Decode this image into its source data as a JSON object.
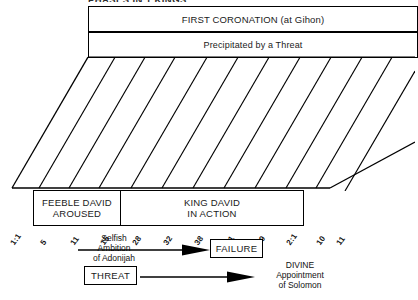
{
  "chart": {
    "title": "PHASES IN 1 KINGS"
  },
  "banner": {
    "heading": "FIRST CORONATION (at Gihon)",
    "subheading": "Precipitated by a Threat"
  },
  "stripes": {
    "verse_labels": [
      "1:1",
      "5",
      "11",
      "15",
      "28",
      "32",
      "38",
      "41",
      "49",
      "2:1",
      "10",
      "11"
    ]
  },
  "sections": [
    {
      "line1": "FEEBLE DAVID",
      "line2": "AROUSED"
    },
    {
      "line1": "KING DAVID",
      "line2": "IN ACTION"
    }
  ],
  "flows": [
    {
      "cause_line1": "Selfish",
      "cause_line2": "Ambition",
      "cause_line3": "of Adonijah",
      "effect": "FAILURE"
    },
    {
      "cause": "THREAT",
      "effect_line1": "DIVINE",
      "effect_line2": "Appointment",
      "effect_line3": "of Solomon"
    }
  ],
  "colors": {
    "ink": "#000000",
    "paper": "#ffffff"
  }
}
